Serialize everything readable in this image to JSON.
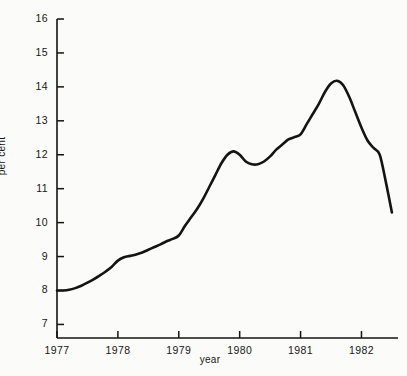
{
  "chart_data": {
    "type": "line",
    "title": "",
    "xlabel": "year",
    "ylabel": "per cent",
    "xlim": [
      1977,
      1982.6
    ],
    "ylim": [
      6.6,
      16
    ],
    "grid": false,
    "legend": "none",
    "x_tick_labels": [
      "1977",
      "1978",
      "1979",
      "1980",
      "1981",
      "1982"
    ],
    "x_ticks": [
      1977,
      1978,
      1979,
      1980,
      1981,
      1982
    ],
    "y_tick_labels": [
      "7",
      "8",
      "9",
      "10",
      "11",
      "12",
      "13",
      "14",
      "15",
      "16"
    ],
    "y_ticks": [
      7,
      8,
      9,
      10,
      11,
      12,
      13,
      14,
      15,
      16
    ],
    "series": [
      {
        "name": "per cent",
        "color": "#141414",
        "x": [
          1977.0,
          1977.1,
          1977.2,
          1977.3,
          1977.4,
          1977.5,
          1977.6,
          1977.7,
          1977.8,
          1977.9,
          1978.0,
          1978.1,
          1978.2,
          1978.3,
          1978.4,
          1978.5,
          1978.6,
          1978.7,
          1978.8,
          1978.9,
          1979.0,
          1979.1,
          1979.2,
          1979.3,
          1979.4,
          1979.5,
          1979.6,
          1979.7,
          1979.8,
          1979.9,
          1980.0,
          1980.1,
          1980.2,
          1980.3,
          1980.4,
          1980.5,
          1980.6,
          1980.7,
          1980.8,
          1980.9,
          1981.0,
          1981.1,
          1981.2,
          1981.3,
          1981.4,
          1981.5,
          1981.6,
          1981.7,
          1981.8,
          1981.9,
          1982.0,
          1982.1,
          1982.2,
          1982.3,
          1982.4,
          1982.5
        ],
        "y": [
          8.0,
          8.0,
          8.02,
          8.07,
          8.14,
          8.23,
          8.33,
          8.44,
          8.56,
          8.7,
          8.88,
          8.98,
          9.02,
          9.06,
          9.12,
          9.2,
          9.28,
          9.36,
          9.45,
          9.52,
          9.62,
          9.9,
          10.15,
          10.4,
          10.7,
          11.05,
          11.4,
          11.75,
          12.0,
          12.1,
          12.0,
          11.8,
          11.72,
          11.72,
          11.8,
          11.95,
          12.15,
          12.3,
          12.45,
          12.52,
          12.6,
          12.9,
          13.2,
          13.5,
          13.85,
          14.1,
          14.18,
          14.05,
          13.7,
          13.25,
          12.8,
          12.42,
          12.2,
          12.0,
          11.2,
          10.3
        ]
      }
    ]
  },
  "axes": {
    "left_axis_name": "y-axis",
    "bottom_axis_name": "x-axis"
  }
}
